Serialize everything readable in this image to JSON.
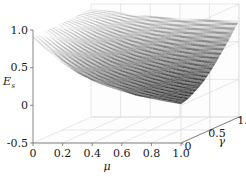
{
  "chart_data": {
    "type": "surface",
    "title": "",
    "xlabel": "μ",
    "ylabel": "γ",
    "zlabel": "E",
    "zlabel_sub": "s",
    "xlim": [
      0,
      1.0
    ],
    "ylim": [
      0,
      1.0
    ],
    "zlim": [
      -0.5,
      1.0
    ],
    "xticks": [
      "0",
      "0.2",
      "0.4",
      "0.6",
      "0.8",
      "1.0"
    ],
    "xtick_values": [
      0,
      0.2,
      0.4,
      0.6,
      0.8,
      1.0
    ],
    "yticks": [
      "0",
      "0.5",
      "1.0"
    ],
    "ytick_values": [
      0,
      0.5,
      1.0
    ],
    "zticks": [
      "-0.5",
      "0",
      "0.5",
      "1.0"
    ],
    "ztick_values": [
      -0.5,
      0,
      0.5,
      1.0
    ],
    "grid": true,
    "legend": "none",
    "colormap": "grayscale",
    "mesh_density": "fine",
    "surface_description": "Saddle-like surface: high ridge near mu=0 and along high-gamma edge, dipping to a low valley near mu=0.8-1.0 at low gamma, rising back up at the far right corner.",
    "z_corner_values": {
      "mu0_gamma0": 0.9,
      "mu0_gamma1": 0.92,
      "mu1_gamma0": 0.02,
      "mu1_gamma1": 0.78
    },
    "x_samples": [
      0,
      0.1,
      0.2,
      0.3,
      0.4,
      0.5,
      0.6,
      0.7,
      0.8,
      0.9,
      1.0
    ],
    "y_samples": [
      0,
      0.1,
      0.2,
      0.3,
      0.4,
      0.5,
      0.6,
      0.7,
      0.8,
      0.9,
      1.0
    ],
    "z_grid": [
      [
        0.9,
        0.9,
        0.91,
        0.91,
        0.91,
        0.92,
        0.92,
        0.92,
        0.93,
        0.93,
        0.93
      ],
      [
        0.72,
        0.74,
        0.76,
        0.78,
        0.8,
        0.82,
        0.84,
        0.86,
        0.88,
        0.9,
        0.91
      ],
      [
        0.56,
        0.59,
        0.62,
        0.65,
        0.68,
        0.71,
        0.75,
        0.78,
        0.82,
        0.86,
        0.89
      ],
      [
        0.43,
        0.46,
        0.5,
        0.54,
        0.58,
        0.62,
        0.67,
        0.71,
        0.76,
        0.81,
        0.86
      ],
      [
        0.33,
        0.36,
        0.4,
        0.44,
        0.49,
        0.54,
        0.59,
        0.65,
        0.71,
        0.77,
        0.84
      ],
      [
        0.25,
        0.28,
        0.32,
        0.37,
        0.42,
        0.47,
        0.53,
        0.6,
        0.67,
        0.74,
        0.82
      ],
      [
        0.19,
        0.22,
        0.26,
        0.31,
        0.36,
        0.42,
        0.48,
        0.56,
        0.64,
        0.72,
        0.81
      ],
      [
        0.13,
        0.16,
        0.2,
        0.25,
        0.31,
        0.37,
        0.44,
        0.52,
        0.61,
        0.7,
        0.8
      ],
      [
        0.09,
        0.11,
        0.15,
        0.2,
        0.26,
        0.33,
        0.41,
        0.49,
        0.59,
        0.69,
        0.79
      ],
      [
        0.05,
        0.07,
        0.11,
        0.16,
        0.22,
        0.29,
        0.38,
        0.47,
        0.57,
        0.68,
        0.78
      ],
      [
        0.02,
        0.04,
        0.08,
        0.13,
        0.19,
        0.27,
        0.36,
        0.46,
        0.56,
        0.67,
        0.78
      ]
    ],
    "colors": {
      "axis": "#7a7a7a",
      "grid": "#d8d8d8",
      "text": "#1a1a1a",
      "mesh_light": "#ffffff",
      "mesh_dark": "#121212",
      "background": "#ffffff"
    }
  }
}
